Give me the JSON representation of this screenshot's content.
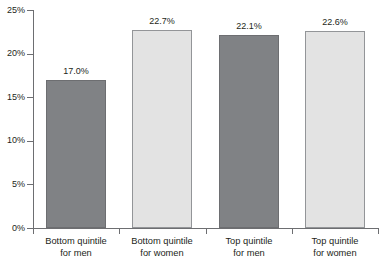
{
  "chart_data": {
    "type": "bar",
    "title": "",
    "xlabel": "",
    "ylabel": "",
    "ylim": [
      0,
      25
    ],
    "grid": false,
    "legend": "none",
    "y_tick_labels": [
      "0%",
      "5%",
      "10%",
      "15%",
      "20%",
      "25%"
    ],
    "y_tick_values": [
      0,
      5,
      10,
      15,
      20,
      25
    ],
    "categories": [
      "Bottom quintile for men",
      "Bottom quintile for women",
      "Top quintile for men",
      "Top quintile for women"
    ],
    "values": [
      17.0,
      22.7,
      22.1,
      22.6
    ],
    "data_labels": [
      "17.0%",
      "22.7%",
      "22.1%",
      "22.6%"
    ],
    "bar_styles": [
      "dark",
      "light",
      "dark",
      "light"
    ]
  },
  "axis": {
    "y_ticks": [
      {
        "label": "25%",
        "value": 25
      },
      {
        "label": "20%",
        "value": 20
      },
      {
        "label": "15%",
        "value": 15
      },
      {
        "label": "10%",
        "value": 10
      },
      {
        "label": "5%",
        "value": 5
      },
      {
        "label": "0%",
        "value": 0
      }
    ]
  },
  "categories": [
    {
      "line1": "Bottom quintile",
      "line2": "for men"
    },
    {
      "line1": "Bottom quintile",
      "line2": "for women"
    },
    {
      "line1": "Top quintile",
      "line2": "for men"
    },
    {
      "line1": "Top quintile",
      "line2": "for women"
    }
  ],
  "bars": [
    {
      "value_label": "17.0%"
    },
    {
      "value_label": "22.7%"
    },
    {
      "value_label": "22.1%"
    },
    {
      "value_label": "22.6%"
    }
  ],
  "title_remnant": "",
  "colors": {
    "bar_dark": "#808285",
    "bar_dark_border": "#6d6e71",
    "bar_light": "#e3e3e3",
    "bar_light_border": "#939598",
    "axis": "#6d6e71",
    "text": "#231f20",
    "background": "#ffffff"
  }
}
